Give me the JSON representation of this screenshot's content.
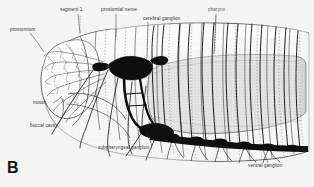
{
  "figure": {
    "panel_letter": "B",
    "background_color": "#f4f4f2",
    "ink_color": "#1d1d1d",
    "width": 314,
    "height": 187
  },
  "labels": [
    {
      "id": "prostomium",
      "text": "prostomium",
      "x": 10,
      "y": 31,
      "leader_to_x": 42,
      "leader_to_y": 52
    },
    {
      "id": "segment-1",
      "text": "segment 1",
      "x": 60,
      "y": 10,
      "leader_to_x": 80,
      "leader_to_y": 34
    },
    {
      "id": "prostomial-nerve",
      "text": "prostomial nerve",
      "x": 102,
      "y": 10,
      "leader_to_x": 116,
      "leader_to_y": 38
    },
    {
      "id": "cerebral-ganglion",
      "text": "cerebral ganglion",
      "x": 145,
      "y": 19,
      "leader_to_x": 147,
      "leader_to_y": 60
    },
    {
      "id": "pharynx",
      "text": "pharynx",
      "x": 209,
      "y": 10,
      "leader_to_x": 214,
      "leader_to_y": 55
    },
    {
      "id": "mouth",
      "text": "mouth",
      "x": 35,
      "y": 104,
      "leader_to_x": 62,
      "leader_to_y": 96
    },
    {
      "id": "buccal-cavity",
      "text": "buccal cavity",
      "x": 32,
      "y": 126,
      "leader_to_x": 66,
      "leader_to_y": 110
    },
    {
      "id": "subpharyngeal-ganglion",
      "text": "subpharyngeal ganglion",
      "x": 100,
      "y": 147,
      "leader_to_x": 140,
      "leader_to_y": 131
    },
    {
      "id": "ventral-ganglion",
      "text": "ventral ganglion",
      "x": 250,
      "y": 165,
      "leader_to_x": 262,
      "leader_to_y": 148
    }
  ]
}
